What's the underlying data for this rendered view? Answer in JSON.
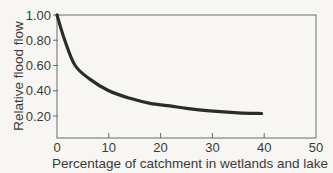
{
  "chart_data": {
    "type": "line",
    "title": "",
    "xlabel": "Percentage of catchment in wetlands and lake",
    "ylabel": "Relative flood flow",
    "xlim": [
      0,
      50
    ],
    "ylim": [
      0,
      1.0
    ],
    "xticks": [
      "0",
      "10",
      "20",
      "30",
      "40",
      "50"
    ],
    "yticks": [
      "0.20",
      "0.40",
      "0.60",
      "0.80",
      "1.00"
    ],
    "grid": false,
    "legend": null,
    "series": [
      {
        "name": "Relative flood flow",
        "x": [
          0,
          1.5,
          3.5,
          6.4,
          10,
          14.1,
          18,
          21.8,
          25,
          29.5,
          35,
          39.5
        ],
        "y": [
          1.0,
          0.8,
          0.6,
          0.49,
          0.4,
          0.34,
          0.3,
          0.28,
          0.26,
          0.24,
          0.225,
          0.22
        ]
      }
    ],
    "colors": {
      "line": "#2b2b2b",
      "axes": "#5a5a5a",
      "background": "#f7f6f3"
    }
  }
}
